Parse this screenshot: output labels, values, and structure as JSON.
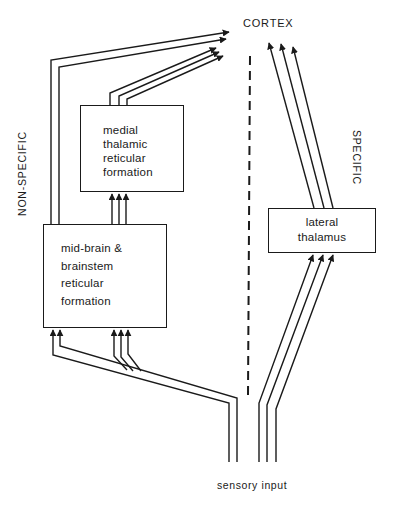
{
  "diagram": {
    "title_label": "CORTEX",
    "left_side_label": "NON-SPECIFIC",
    "right_side_label": "SPECIFIC",
    "bottom_label": "sensory input",
    "boxes": {
      "medial": {
        "lines": [
          "medial",
          "thalamic",
          "reticular",
          "formation"
        ]
      },
      "midbrain": {
        "lines": [
          "mid-brain &",
          "brainstem",
          "reticular",
          "formation"
        ]
      },
      "lateral": {
        "lines": [
          "lateral",
          "thalamus"
        ]
      }
    },
    "divider": {
      "style": "dashed",
      "meaning": "separates non-specific and specific pathways"
    },
    "pathways": [
      {
        "from": "sensory input",
        "to": "mid-brain & brainstem reticular formation",
        "count": 2
      },
      {
        "from": "sensory input",
        "to": "mid-brain & brainstem reticular formation",
        "count": 3
      },
      {
        "from": "mid-brain & brainstem reticular formation",
        "to": "CORTEX",
        "count": 2
      },
      {
        "from": "mid-brain & brainstem reticular formation",
        "to": "medial thalamic reticular formation",
        "count": 3
      },
      {
        "from": "medial thalamic reticular formation",
        "to": "CORTEX",
        "count": 3
      },
      {
        "from": "sensory input",
        "to": "lateral thalamus",
        "count": 3
      },
      {
        "from": "lateral thalamus",
        "to": "CORTEX",
        "count": 3
      }
    ]
  }
}
